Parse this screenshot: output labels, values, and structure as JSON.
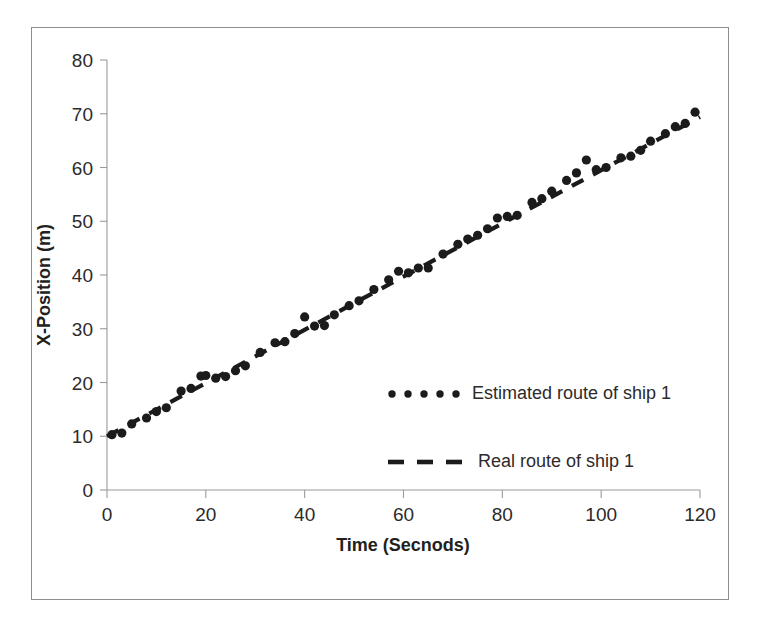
{
  "figure": {
    "has_border": true,
    "background": "#ffffff",
    "ink_color": "#1b1b1b",
    "axis_color": "#9a9a9a"
  },
  "chart_data": {
    "type": "scatter",
    "title": "",
    "xlabel": "Time (Secnods)",
    "ylabel": "X-Position (m)",
    "xlim": [
      0,
      120
    ],
    "ylim": [
      0,
      80
    ],
    "xticks": [
      0,
      20,
      40,
      60,
      80,
      100,
      120
    ],
    "yticks": [
      0,
      10,
      20,
      30,
      40,
      50,
      60,
      70,
      80
    ],
    "grid": false,
    "legend_position": "center-right-inside",
    "series": [
      {
        "name": "Estimated route of ship 1",
        "style": "dotted-markers",
        "marker": "circle",
        "color": "#1b1b1b",
        "x": [
          1,
          3,
          5,
          8,
          10,
          12,
          15,
          17,
          19,
          20,
          22,
          24,
          26,
          28,
          31,
          34,
          36,
          38,
          40,
          42,
          44,
          46,
          49,
          51,
          54,
          57,
          59,
          61,
          63,
          65,
          68,
          71,
          73,
          75,
          77,
          79,
          81,
          83,
          86,
          88,
          90,
          93,
          95,
          97,
          99,
          101,
          104,
          106,
          108,
          110,
          113,
          115,
          117,
          119
        ],
        "y": [
          10.3,
          10.6,
          12.3,
          13.4,
          14.6,
          15.3,
          18.4,
          18.9,
          21.2,
          21.3,
          20.8,
          21.1,
          22.2,
          23.1,
          25.6,
          27.4,
          27.6,
          29.1,
          32.2,
          30.5,
          30.6,
          32.6,
          34.3,
          35.2,
          37.3,
          39.1,
          40.7,
          40.4,
          41.3,
          41.3,
          43.9,
          45.7,
          46.7,
          47.4,
          48.6,
          50.6,
          50.9,
          51.1,
          53.5,
          54.2,
          55.6,
          57.6,
          59.0,
          61.4,
          59.6,
          60.0,
          61.8,
          62.1,
          63.2,
          64.9,
          66.3,
          67.6,
          68.2,
          70.3
        ]
      },
      {
        "name": "Real route of ship 1",
        "style": "dashed-line",
        "color": "#1b1b1b",
        "x": [
          0,
          120
        ],
        "y": [
          10.0,
          69.4
        ]
      }
    ]
  },
  "legend": {
    "entries": [
      {
        "label": "Estimated route of ship 1",
        "marker": "dotted"
      },
      {
        "label": "Real route of ship 1",
        "marker": "dashed"
      }
    ]
  }
}
